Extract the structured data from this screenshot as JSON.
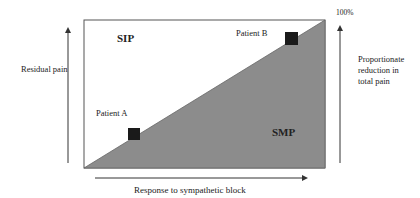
{
  "diagram": {
    "regions": {
      "upper": "SIP",
      "lower": "SMP"
    },
    "patients": [
      {
        "label": "Patient A",
        "position": "low response"
      },
      {
        "label": "Patient B",
        "position": "high response"
      }
    ],
    "axes": {
      "left": "Residual pain",
      "bottom": "Response to sympathetic block",
      "right_top": "100%",
      "right": [
        "Proportionate",
        "reduction in",
        "total pain"
      ]
    },
    "colors": {
      "triangle_fill": "#8c8c8c",
      "marker": "#1a1a1a",
      "border": "#555555"
    }
  }
}
